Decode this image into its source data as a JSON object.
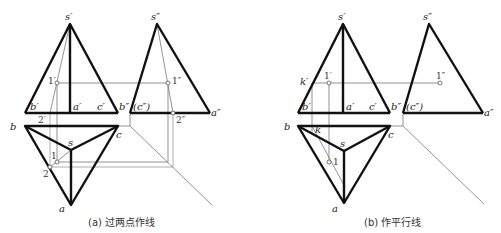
{
  "panels": [
    {
      "id": "a",
      "caption": "(a) 过两点作线",
      "labels": {
        "s_front": "s′",
        "s_side": "s″",
        "b_front": "b′",
        "a_front": "a′",
        "c_front": "c′",
        "b_side": "b″",
        "c_side": "(c″)",
        "a_side": "a″",
        "p1_front": "1′",
        "p1_side": "1″",
        "p2_front": "2′",
        "p2_side": "2″",
        "b_plan": "b",
        "c_plan": "c",
        "s_plan": "s",
        "a_plan": "a",
        "p1_plan": "1",
        "p2_plan": "2"
      }
    },
    {
      "id": "b",
      "caption": "(b) 作平行线",
      "labels": {
        "s_front": "s′",
        "s_side": "s″",
        "k_front": "k′",
        "p1_front": "1′",
        "p1_side": "1″",
        "b_front": "b′",
        "a_front": "a′",
        "c_front": "c′",
        "b_side": "b″",
        "c_side": "(c″)",
        "a_side": "a″",
        "b_plan": "b",
        "k_plan": "k",
        "c_plan": "c",
        "s_plan": "s",
        "p1_plan": "1",
        "a_plan": "a"
      }
    }
  ]
}
